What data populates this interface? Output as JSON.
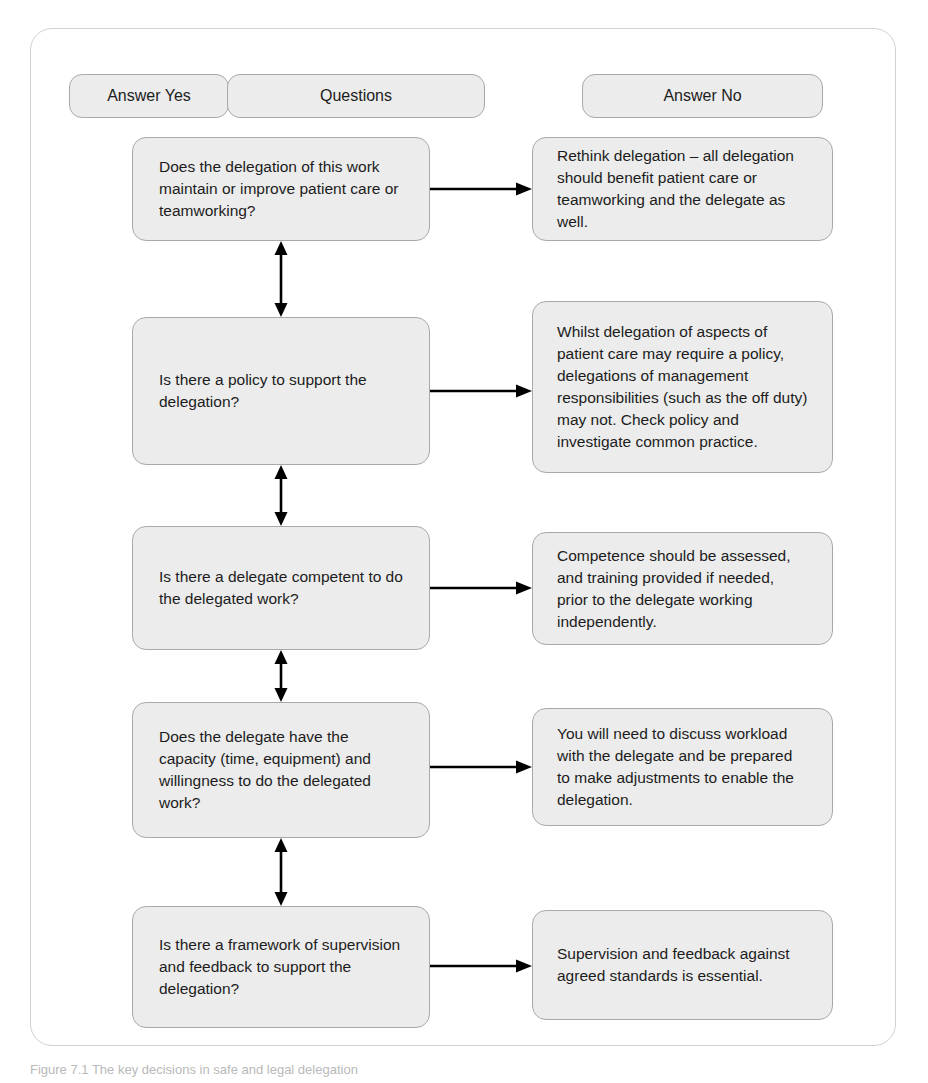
{
  "figure": {
    "caption": "Figure 7.1  The key decisions in safe and legal delegation"
  },
  "columns": {
    "answer_yes_label": "Answer Yes",
    "questions_label": "Questions",
    "answer_no_label": "Answer No"
  },
  "rows": [
    {
      "question": "Does the delegation of this work maintain or improve patient care or teamworking?",
      "answer_no": "Rethink delegation – all delegation should benefit patient care or teamworking and the delegate as well."
    },
    {
      "question": "Is there a policy to support the delegation?",
      "answer_no": "Whilst delegation of aspects of patient care may require a policy, delegations of management responsibilities (such as the off duty) may not. Check policy and investigate common practice."
    },
    {
      "question": "Is there a delegate competent to do the delegated work?",
      "answer_no": "Competence should be assessed, and training provided if needed, prior to the delegate working independently."
    },
    {
      "question": "Does the delegate have the capacity (time, equipment) and willingness to do the delegated work?",
      "answer_no": "You will need to discuss workload with the delegate and be prepared to make adjustments to enable the delegation."
    },
    {
      "question": "Is there a framework of supervision and feedback to support the delegation?",
      "answer_no": "Supervision and feedback against agreed standards is essential."
    }
  ],
  "colors": {
    "node_fill": "#ececec",
    "node_border": "#a9a9a9",
    "frame_border": "#d2d2d2",
    "arrow": "#000000",
    "text": "#1c1c1c"
  }
}
